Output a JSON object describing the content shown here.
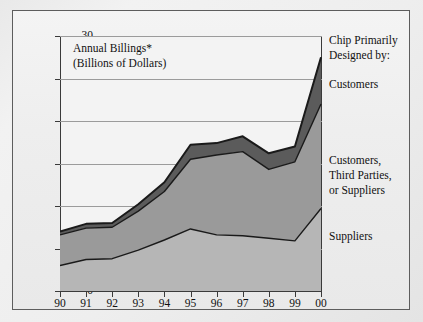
{
  "figure": {
    "title_line1": "Annual Billings*",
    "title_line2": "(Billions of Dollars)"
  },
  "legend": {
    "heading_line1": "Chip Primarily",
    "heading_line2": "Designed by:",
    "items": [
      {
        "label": "Customers",
        "color": "#5b5b5b"
      },
      {
        "label_line1": "Customers,",
        "label_line2": "Third Parties,",
        "label_line3": "or Suppliers",
        "color": "#9a9a9a"
      },
      {
        "label": "Suppliers",
        "color": "#b6b6b6"
      }
    ]
  },
  "chart_data": {
    "type": "area",
    "title": "Annual Billings* (Billions of Dollars)",
    "xlabel": "",
    "ylabel": "Annual Billings (Billions of Dollars)",
    "categories": [
      "90",
      "91",
      "92",
      "93",
      "94",
      "95",
      "96",
      "97",
      "98",
      "99",
      "00"
    ],
    "x_tick_labels": [
      "90",
      "91",
      "92",
      "93",
      "94",
      "95",
      "96",
      "97",
      "98",
      "99",
      "00"
    ],
    "y_tick_labels": [
      "0",
      "5",
      "10",
      "15",
      "20",
      "25",
      "30"
    ],
    "y_ticks": [
      0,
      5,
      10,
      15,
      20,
      25,
      30
    ],
    "ylim": [
      0,
      30
    ],
    "grid": true,
    "stacked": true,
    "legend_position": "right",
    "series": [
      {
        "name": "Suppliers",
        "color": "#b6b6b6",
        "values": [
          3.0,
          3.7,
          3.8,
          4.8,
          6.0,
          7.3,
          6.6,
          6.5,
          6.2,
          5.9,
          9.7
        ]
      },
      {
        "name": "Customers, Third Parties, or Suppliers",
        "color": "#9a9a9a",
        "values": [
          3.6,
          3.7,
          3.7,
          4.6,
          5.7,
          8.2,
          9.4,
          9.9,
          8.1,
          9.3,
          12.3
        ]
      },
      {
        "name": "Customers",
        "color": "#5b5b5b",
        "values": [
          0.4,
          0.5,
          0.5,
          0.8,
          1.1,
          1.7,
          1.4,
          1.8,
          1.9,
          1.8,
          5.5
        ]
      }
    ],
    "cumulative_tops": {
      "suppliers": [
        3.0,
        3.7,
        3.8,
        4.8,
        6.0,
        7.3,
        6.6,
        6.5,
        6.2,
        5.9,
        9.7
      ],
      "mid": [
        6.6,
        7.4,
        7.5,
        9.4,
        11.7,
        15.5,
        16.0,
        16.4,
        14.3,
        15.2,
        22.0
      ],
      "total": [
        7.0,
        7.9,
        8.0,
        10.2,
        12.8,
        17.2,
        17.4,
        18.2,
        16.2,
        17.0,
        27.5
      ]
    }
  },
  "colors": {
    "band_top": "#5b5b5b",
    "band_mid": "#9a9a9a",
    "band_bottom": "#b6b6b6",
    "outline": "#1a1a1a",
    "axis": "#3a3a3a",
    "gridline": "#9b9b9b",
    "plot_background": "#f3f3f3"
  }
}
